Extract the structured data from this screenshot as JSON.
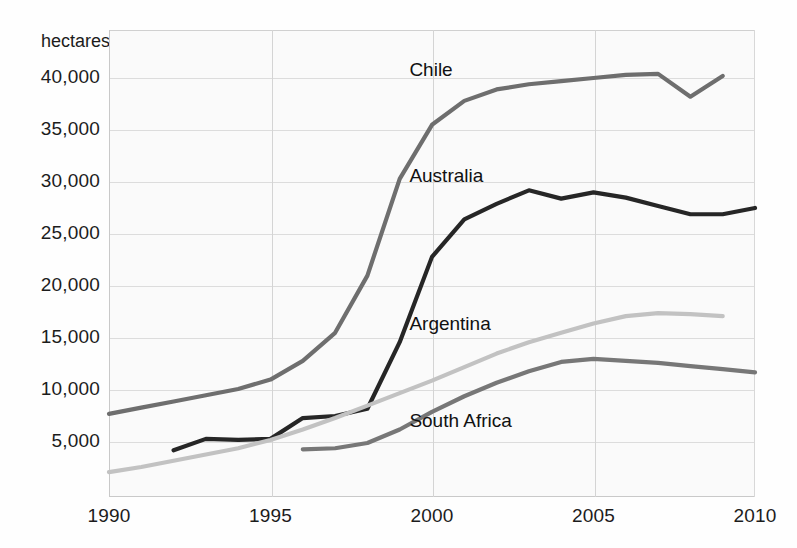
{
  "chart_data": {
    "type": "line",
    "title": "",
    "subtitle": "",
    "xlabel": "",
    "ylabel": "hectares",
    "ylabel_position": "top-left",
    "grid": true,
    "legend": "inline-labels",
    "xlim": [
      1990,
      2010
    ],
    "ylim": [
      0,
      42500
    ],
    "yticks": [
      5000,
      10000,
      15000,
      20000,
      25000,
      30000,
      35000,
      40000
    ],
    "ytick_labels": [
      "5,000",
      "10,000",
      "15,000",
      "20,000",
      "25,000",
      "30,000",
      "35,000",
      "40,000"
    ],
    "xticks": [
      1990,
      1995,
      2000,
      2005,
      2010
    ],
    "xtick_labels": [
      "1990",
      "1995",
      "2000",
      "2005",
      "2010"
    ],
    "series": [
      {
        "name": "Chile",
        "color": "#6e6e6e",
        "label_x": 1999.3,
        "label_y": 40600,
        "x": [
          1990,
          1991,
          1992,
          1993,
          1994,
          1995,
          1996,
          1997,
          1998,
          1999,
          2000,
          2001,
          2002,
          2003,
          2004,
          2005,
          2006,
          2007,
          2008,
          2009
        ],
        "y": [
          7700,
          8300,
          8900,
          9500,
          10100,
          11000,
          12800,
          15500,
          21000,
          30300,
          35500,
          37800,
          38900,
          39400,
          39700,
          40000,
          40300,
          40400,
          38200,
          40200
        ]
      },
      {
        "name": "Australia",
        "color": "#262626",
        "label_x": 1999.3,
        "label_y": 30400,
        "x": [
          1992,
          1993,
          1994,
          1995,
          1996,
          1997,
          1998,
          1999,
          2000,
          2001,
          2002,
          2003,
          2004,
          2005,
          2006,
          2007,
          2008,
          2009,
          2010
        ],
        "y": [
          4200,
          5300,
          5200,
          5300,
          7300,
          7500,
          8200,
          14600,
          22800,
          26400,
          27900,
          29200,
          28400,
          29000,
          28500,
          27700,
          26900,
          26900,
          27500
        ]
      },
      {
        "name": "Argentina",
        "color": "#c2c2c2",
        "label_x": 1999.3,
        "label_y": 16200,
        "x": [
          1990,
          1991,
          1992,
          1993,
          1994,
          1995,
          1996,
          1997,
          1998,
          1999,
          2000,
          2001,
          2002,
          2003,
          2004,
          2005,
          2006,
          2007,
          2008,
          2009
        ],
        "y": [
          2100,
          2600,
          3200,
          3800,
          4400,
          5200,
          6200,
          7300,
          8500,
          9700,
          10900,
          12200,
          13500,
          14600,
          15500,
          16400,
          17100,
          17400,
          17300,
          17100
        ]
      },
      {
        "name": "South Africa",
        "color": "#777777",
        "label_x": 1999.3,
        "label_y": 6800,
        "x": [
          1996,
          1997,
          1998,
          1999,
          2000,
          2001,
          2002,
          2003,
          2004,
          2005,
          2006,
          2007,
          2008,
          2009,
          2010
        ],
        "y": [
          4300,
          4400,
          4900,
          6200,
          7900,
          9400,
          10700,
          11800,
          12700,
          13000,
          12800,
          12600,
          12300,
          12000,
          11700
        ]
      }
    ]
  }
}
